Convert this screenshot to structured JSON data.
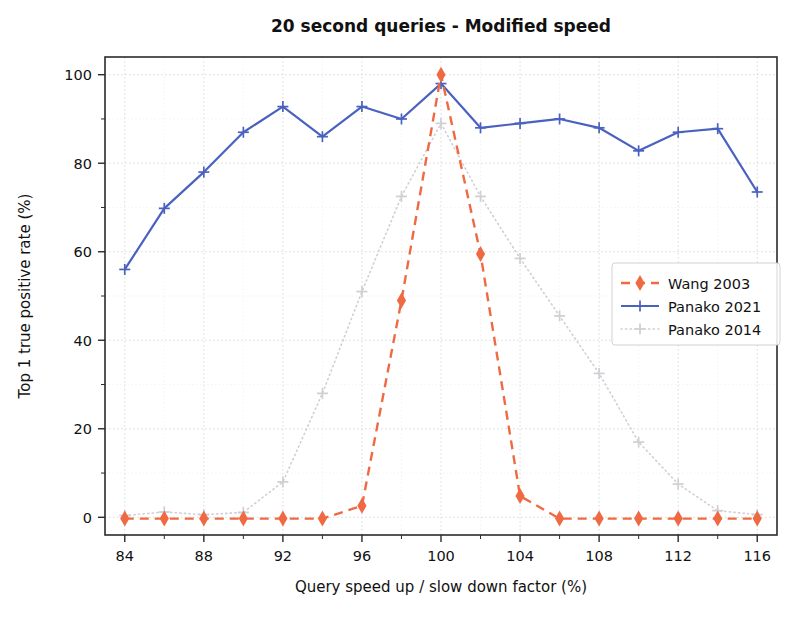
{
  "chart_data": {
    "type": "line",
    "title": "20 second queries - Modified speed",
    "xlabel": "Query speed up / slow down factor (%)",
    "ylabel": "Top 1 true positive rate (%)",
    "xlim": [
      83,
      117
    ],
    "ylim": [
      -4,
      104
    ],
    "xticks": [
      84,
      88,
      92,
      96,
      100,
      104,
      108,
      112,
      116
    ],
    "xtick_labels": [
      "84",
      "88",
      "92",
      "96",
      "100",
      "104",
      "108",
      "112",
      "116"
    ],
    "xminor_step": 2,
    "yticks": [
      0,
      20,
      40,
      60,
      80,
      100
    ],
    "ytick_labels": [
      "0",
      "20",
      "40",
      "60",
      "80",
      "100"
    ],
    "yminor_step": 10,
    "grid": true,
    "legend_position": "center right",
    "x": [
      84,
      86,
      88,
      90,
      92,
      94,
      96,
      98,
      100,
      102,
      104,
      106,
      108,
      110,
      112,
      114,
      116
    ],
    "series": [
      {
        "name": "Wang 2003",
        "color": "#ef6a43",
        "linestyle": "dashed",
        "marker": "diamond",
        "values": [
          -0.3,
          -0.3,
          -0.3,
          -0.3,
          -0.3,
          -0.3,
          2.6,
          49.0,
          100.0,
          59.5,
          4.8,
          -0.3,
          -0.3,
          -0.3,
          -0.3,
          -0.3,
          -0.3
        ]
      },
      {
        "name": "Panako 2021",
        "color": "#4a61c0",
        "linestyle": "solid",
        "marker": "plus",
        "values": [
          56.0,
          69.8,
          78.0,
          87.0,
          92.8,
          86.0,
          92.8,
          90.0,
          98.0,
          88.0,
          89.0,
          90.0,
          88.0,
          82.8,
          87.0,
          87.8,
          73.5
        ]
      },
      {
        "name": "Panako 2014",
        "color": "#cfcfd4",
        "linestyle": "dotted",
        "marker": "plus",
        "values": [
          0.4,
          1.2,
          0.6,
          1.1,
          8.0,
          28.0,
          51.0,
          72.5,
          89.0,
          72.5,
          58.5,
          45.5,
          32.5,
          17.0,
          7.5,
          1.5,
          0.6
        ]
      }
    ]
  },
  "legend": {
    "entries": [
      {
        "label": "Wang 2003"
      },
      {
        "label": "Panako 2021"
      },
      {
        "label": "Panako 2014"
      }
    ]
  }
}
